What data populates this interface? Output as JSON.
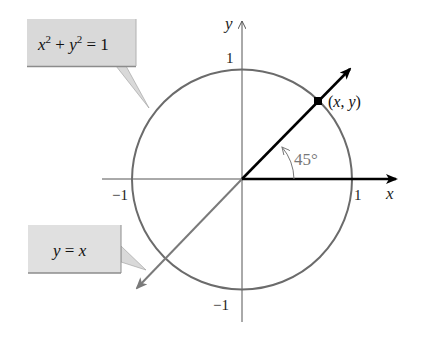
{
  "diagram": {
    "axes": {
      "x_label": "x",
      "y_label": "y",
      "x_tick_pos": "1",
      "x_tick_neg": "−1",
      "y_tick_pos": "1",
      "y_tick_neg": "−1"
    },
    "point_label": "(x, y)",
    "point_label_x": "x",
    "point_label_y": "y",
    "angle_label": "45°",
    "callouts": {
      "circle": {
        "x": "x",
        "x_exp": "2",
        "plus": " + ",
        "y": "y",
        "y_exp": "2",
        "eq": " = 1",
        "text": "x² + y² = 1"
      },
      "line": {
        "y": "y",
        "eq": " = ",
        "x": "x",
        "text": "y = x"
      }
    },
    "colors": {
      "circle": "#6b6b6b",
      "axes": "#555555",
      "ray": "#000000",
      "line": "#7a7a7a",
      "callout_fill": "#d9d9d9",
      "callout_shadow": "#8c8c8c",
      "angle": "#777777"
    }
  }
}
